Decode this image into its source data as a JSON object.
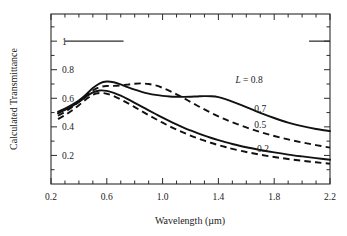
{
  "figure": {
    "background": "#ffffff",
    "ink_color": "#111111"
  },
  "chart_data": {
    "type": "line",
    "title": "",
    "xlabel": "Wavelength (µm)",
    "ylabel": "Calculated Transmittance",
    "xlim": [
      0.2,
      2.2
    ],
    "ylim": [
      0.0,
      1.19
    ],
    "grid": false,
    "legend_position": "inline-annotations",
    "xticks": [
      0.2,
      0.6,
      1.0,
      1.4,
      1.8,
      2.2
    ],
    "xtick_labels": [
      "0.2",
      "0.6",
      "1.0",
      "1.4",
      "1.8",
      "2.2"
    ],
    "xticks_minor_step": 0.1,
    "yticks": [
      0.2,
      0.4,
      0.6,
      0.8,
      1.0
    ],
    "ytick_labels": [
      "0.2",
      "0.4",
      "0.6",
      "0.8",
      "1"
    ],
    "yticks_minor_step": 0.1,
    "annotations": [
      {
        "text": "L = 0.8",
        "x": 1.62,
        "y": 0.705,
        "italic_prefix": "L",
        "rest": " = 0.8"
      },
      {
        "text": "0.7",
        "x": 1.7,
        "y": 0.505,
        "italic_prefix": "",
        "rest": "0.7"
      },
      {
        "text": "0.5",
        "x": 1.7,
        "y": 0.395,
        "italic_prefix": "",
        "rest": "0.5"
      },
      {
        "text": "0.2",
        "x": 1.72,
        "y": 0.225,
        "italic_prefix": "",
        "rest": "0.2"
      }
    ],
    "reference_segments": [
      {
        "name": "left-unity-segment",
        "y": 1.0,
        "x_start": 0.3,
        "x_end": 0.72,
        "style": "solid"
      },
      {
        "name": "right-unity-segment",
        "y": 1.0,
        "x_start": 2.05,
        "x_end": 2.2,
        "style": "solid"
      }
    ],
    "x": [
      0.25,
      0.3,
      0.35,
      0.4,
      0.45,
      0.5,
      0.55,
      0.6,
      0.65,
      0.7,
      0.75,
      0.8,
      0.85,
      0.9,
      0.95,
      1.0,
      1.05,
      1.1,
      1.15,
      1.2,
      1.25,
      1.3,
      1.35,
      1.4,
      1.45,
      1.5,
      1.6,
      1.7,
      1.8,
      1.9,
      2.0,
      2.1,
      2.2
    ],
    "series": [
      {
        "name": "L = 0.8",
        "label": "0.8",
        "style": "solid",
        "values": [
          0.505,
          0.528,
          0.555,
          0.585,
          0.625,
          0.672,
          0.705,
          0.717,
          0.712,
          0.697,
          0.678,
          0.66,
          0.645,
          0.633,
          0.624,
          0.617,
          0.613,
          0.611,
          0.61,
          0.611,
          0.613,
          0.615,
          0.614,
          0.608,
          0.594,
          0.576,
          0.538,
          0.498,
          0.462,
          0.43,
          0.405,
          0.385,
          0.37
        ]
      },
      {
        "name": "L = 0.7",
        "label": "0.7",
        "style": "dashed",
        "values": [
          0.478,
          0.505,
          0.538,
          0.575,
          0.615,
          0.655,
          0.678,
          0.686,
          0.687,
          0.69,
          0.696,
          0.702,
          0.704,
          0.7,
          0.69,
          0.673,
          0.652,
          0.628,
          0.602,
          0.575,
          0.548,
          0.522,
          0.497,
          0.474,
          0.452,
          0.432,
          0.396,
          0.364,
          0.336,
          0.312,
          0.291,
          0.272,
          0.255
        ]
      },
      {
        "name": "L = 0.5",
        "label": "0.5",
        "style": "solid",
        "values": [
          0.495,
          0.518,
          0.545,
          0.575,
          0.61,
          0.642,
          0.655,
          0.652,
          0.638,
          0.618,
          0.594,
          0.568,
          0.542,
          0.516,
          0.49,
          0.464,
          0.44,
          0.417,
          0.395,
          0.375,
          0.356,
          0.338,
          0.322,
          0.307,
          0.293,
          0.28,
          0.257,
          0.238,
          0.221,
          0.206,
          0.193,
          0.181,
          0.17
        ]
      },
      {
        "name": "L = 0.2",
        "label": "0.2",
        "style": "dashed",
        "values": [
          0.455,
          0.482,
          0.515,
          0.552,
          0.592,
          0.625,
          0.637,
          0.632,
          0.615,
          0.592,
          0.566,
          0.538,
          0.51,
          0.482,
          0.455,
          0.429,
          0.404,
          0.381,
          0.359,
          0.339,
          0.32,
          0.303,
          0.287,
          0.272,
          0.259,
          0.246,
          0.224,
          0.205,
          0.189,
          0.175,
          0.163,
          0.152,
          0.142
        ]
      }
    ]
  }
}
